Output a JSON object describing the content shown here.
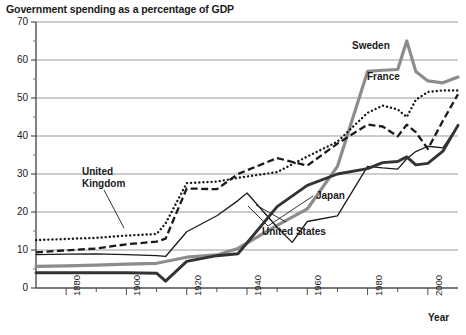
{
  "chart_data": {
    "type": "line",
    "title": "Government spending as a percentage of GDP",
    "xlabel": "Year",
    "ylabel": "",
    "xlim": [
      1870,
      2010
    ],
    "ylim": [
      0,
      70
    ],
    "grid": true,
    "legend_position": "inline-annotations",
    "ytick_labels": [
      "0",
      "10",
      "20",
      "30",
      "40",
      "50",
      "60",
      "70"
    ],
    "ytick_values": [
      0,
      10,
      20,
      30,
      40,
      50,
      60,
      70
    ],
    "yminor_values": [
      5,
      15,
      25,
      35,
      45,
      55,
      65
    ],
    "xtick_labels": [
      "1880",
      "1900",
      "1920",
      "1940",
      "1960",
      "1980",
      "2000"
    ],
    "xtick_values": [
      1880,
      1900,
      1920,
      1940,
      1960,
      1980,
      2000
    ],
    "series": [
      {
        "name": "Sweden",
        "style": "solid-thick-gray",
        "color": "#8c8c8c",
        "x": [
          1870,
          1880,
          1890,
          1900,
          1910,
          1920,
          1930,
          1937,
          1950,
          1960,
          1970,
          1980,
          1985,
          1990,
          1993,
          1996,
          2000,
          2005,
          2010
        ],
        "values": [
          5.7,
          5.8,
          6.0,
          6.3,
          6.5,
          8.1,
          8.7,
          10.4,
          16.5,
          20.8,
          32.0,
          57.0,
          57.3,
          57.5,
          65.0,
          57.0,
          54.5,
          54.0,
          55.5
        ]
      },
      {
        "name": "France",
        "style": "dotted",
        "color": "#1a1a1a",
        "x": [
          1870,
          1880,
          1890,
          1900,
          1910,
          1913,
          1920,
          1930,
          1937,
          1950,
          1960,
          1970,
          1980,
          1985,
          1990,
          1993,
          1996,
          2000,
          2005,
          2010
        ],
        "values": [
          12.6,
          12.9,
          13.2,
          13.8,
          14.2,
          17.0,
          27.6,
          28.0,
          29.0,
          30.5,
          34.6,
          38.5,
          46.1,
          48.0,
          47.0,
          45.0,
          49.5,
          51.6,
          52.0,
          52.0
        ]
      },
      {
        "name": "United Kingdom",
        "style": "dashed",
        "color": "#1a1a1a",
        "x": [
          1870,
          1880,
          1890,
          1900,
          1910,
          1913,
          1920,
          1930,
          1937,
          1950,
          1960,
          1970,
          1980,
          1985,
          1990,
          1993,
          1996,
          2000,
          2005,
          2010
        ],
        "values": [
          9.4,
          9.9,
          10.4,
          11.5,
          12.2,
          13.0,
          26.2,
          26.0,
          30.0,
          34.2,
          32.2,
          38.0,
          43.0,
          42.5,
          39.9,
          43.0,
          41.0,
          36.6,
          44.0,
          51.0
        ]
      },
      {
        "name": "Japan",
        "style": "solid-thin-dark",
        "color": "#1a1a1a",
        "x": [
          1870,
          1880,
          1890,
          1900,
          1910,
          1913,
          1920,
          1930,
          1937,
          1940,
          1950,
          1955,
          1960,
          1970,
          1980,
          1985,
          1990,
          1993,
          1996,
          2000,
          2005,
          2010
        ],
        "values": [
          8.8,
          8.9,
          9.0,
          8.8,
          8.5,
          8.3,
          14.8,
          19.0,
          23.0,
          25.0,
          16.0,
          12.0,
          17.5,
          19.0,
          32.0,
          31.6,
          31.3,
          34.0,
          35.9,
          37.3,
          36.9,
          42.8
        ]
      },
      {
        "name": "United States",
        "style": "solid-thick-dark",
        "color": "#333333",
        "x": [
          1870,
          1880,
          1890,
          1900,
          1910,
          1913,
          1920,
          1930,
          1937,
          1950,
          1960,
          1970,
          1980,
          1985,
          1990,
          1993,
          1996,
          2000,
          2005,
          2010
        ],
        "values": [
          4.0,
          4.0,
          4.0,
          4.0,
          3.9,
          1.8,
          7.0,
          8.5,
          9.0,
          21.4,
          27.0,
          30.0,
          31.4,
          33.0,
          33.3,
          34.5,
          32.4,
          32.8,
          36.0,
          42.8
        ]
      }
    ],
    "annotations": [
      {
        "name": "Sweden",
        "text": "Sweden"
      },
      {
        "name": "France",
        "text": "France"
      },
      {
        "name": "United Kingdom",
        "text": "United\nKingdom"
      },
      {
        "name": "Japan",
        "text": "Japan"
      },
      {
        "name": "United States",
        "text": "United States"
      }
    ]
  },
  "labels": {
    "title": "Government spending as a percentage of GDP",
    "x_axis": "Year",
    "sweden": "Sweden",
    "france": "France",
    "uk_line1": "United",
    "uk_line2": "Kingdom",
    "japan": "Japan",
    "united_states": "United States"
  }
}
